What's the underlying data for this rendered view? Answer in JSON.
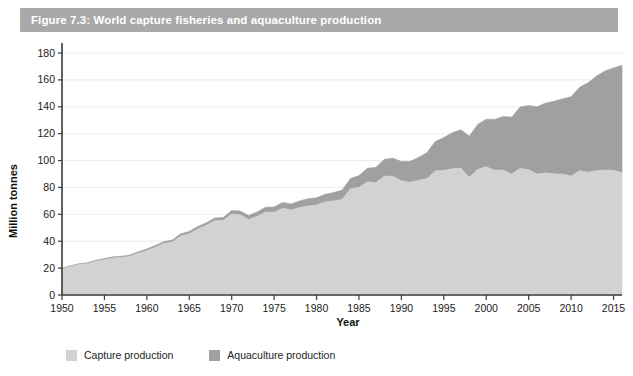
{
  "figure": {
    "title": "Figure 7.3: World capture fisheries and aquaculture production",
    "title_bar_color": "#a9a9a9",
    "background_color": "#ffffff"
  },
  "legend": {
    "position": "bottom-left",
    "items": [
      {
        "label": "Capture production",
        "color": "#d2d2d2"
      },
      {
        "label": "Aquaculture production",
        "color": "#a0a0a0"
      }
    ]
  },
  "axes": {
    "x": {
      "label": "Year",
      "ticks": [
        "1950",
        "1955",
        "1960",
        "1965",
        "1970",
        "1975",
        "1980",
        "1985",
        "1990",
        "1995",
        "2000",
        "2005",
        "2010",
        "2015"
      ],
      "min": 1950,
      "max": 2016
    },
    "y": {
      "label": "Million tonnes",
      "ticks": [
        "0",
        "20",
        "40",
        "60",
        "80",
        "100",
        "120",
        "140",
        "160",
        "180"
      ],
      "min": 0,
      "max": 180
    }
  },
  "chart_data": {
    "type": "area",
    "stacked": true,
    "title": "Figure 7.3: World capture fisheries and aquaculture production",
    "xlabel": "Year",
    "ylabel": "Million tonnes",
    "xlim": [
      1950,
      2016
    ],
    "ylim": [
      0,
      180
    ],
    "grid": "horizontal",
    "legend_position": "bottom-left",
    "units": "million tonnes",
    "x": [
      1950,
      1951,
      1952,
      1953,
      1954,
      1955,
      1956,
      1957,
      1958,
      1959,
      1960,
      1961,
      1962,
      1963,
      1964,
      1965,
      1966,
      1967,
      1968,
      1969,
      1970,
      1971,
      1972,
      1973,
      1974,
      1975,
      1976,
      1977,
      1978,
      1979,
      1980,
      1981,
      1982,
      1983,
      1984,
      1985,
      1986,
      1987,
      1988,
      1989,
      1990,
      1991,
      1992,
      1993,
      1994,
      1995,
      1996,
      1997,
      1998,
      1999,
      2000,
      2001,
      2002,
      2003,
      2004,
      2005,
      2006,
      2007,
      2008,
      2009,
      2010,
      2011,
      2012,
      2013,
      2014,
      2015,
      2016
    ],
    "series": [
      {
        "name": "Capture production",
        "color": "#d2d2d2",
        "values": [
          19.3,
          21.2,
          22.6,
          23.2,
          25.1,
          26.2,
          27.5,
          27.8,
          28.7,
          31.1,
          33.0,
          35.6,
          38.3,
          39.4,
          43.9,
          45.6,
          49.1,
          51.8,
          55.3,
          55.5,
          60.3,
          59.6,
          56.2,
          58.5,
          61.7,
          61.5,
          64.6,
          63.2,
          65.1,
          66.2,
          67.0,
          69.2,
          70.0,
          71.1,
          79.0,
          80.0,
          84.2,
          83.6,
          88.5,
          88.3,
          84.9,
          83.9,
          85.3,
          86.5,
          92.4,
          92.7,
          93.9,
          94.4,
          87.5,
          93.5,
          95.3,
          92.8,
          93.0,
          90.0,
          94.3,
          93.2,
          90.0,
          90.8,
          90.1,
          89.9,
          88.5,
          92.5,
          91.3,
          92.5,
          93.0,
          92.7,
          90.9
        ]
      },
      {
        "name": "Aquaculture production",
        "color": "#a0a0a0",
        "values": [
          0.6,
          0.6,
          0.7,
          0.7,
          0.8,
          0.9,
          0.9,
          1.0,
          1.0,
          1.1,
          1.2,
          1.3,
          1.4,
          1.5,
          1.6,
          1.7,
          1.8,
          1.9,
          2.0,
          2.1,
          2.6,
          2.8,
          3.0,
          3.3,
          3.6,
          3.9,
          4.2,
          4.5,
          4.9,
          5.3,
          5.3,
          5.7,
          6.2,
          6.8,
          7.6,
          8.8,
          10.1,
          11.3,
          12.5,
          13.4,
          14.4,
          15.4,
          17.0,
          19.3,
          21.8,
          24.4,
          26.7,
          28.6,
          30.6,
          33.4,
          35.5,
          37.8,
          39.8,
          42.3,
          45.5,
          47.8,
          50.0,
          52.0,
          54.0,
          56.0,
          59.0,
          62.0,
          66.5,
          70.3,
          73.7,
          76.1,
          80.0
        ]
      }
    ],
    "total_label": "Total production (capture + aquaculture)",
    "total_2016": 170.9
  }
}
